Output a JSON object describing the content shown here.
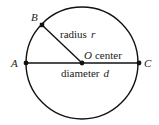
{
  "diagram": {
    "type": "circle-geometry",
    "colors": {
      "stroke": "#111111",
      "text": "#222222",
      "background": "#ffffff"
    },
    "circle": {
      "cx": 82,
      "cy": 63,
      "r": 56
    },
    "points": [
      {
        "id": "A",
        "label": "A",
        "x": 26,
        "y": 63
      },
      {
        "id": "B",
        "label": "B",
        "x": 42,
        "y": 25
      },
      {
        "id": "C",
        "label": "C",
        "x": 139,
        "y": 63
      },
      {
        "id": "O",
        "label": "O",
        "x": 82,
        "y": 63
      }
    ],
    "segments": [
      {
        "from": "A",
        "to": "C",
        "name": "diameter"
      },
      {
        "from": "B",
        "to": "O",
        "name": "radius"
      }
    ],
    "labels": {
      "point_a": "A",
      "point_b": "B",
      "point_c": "C",
      "point_o": "O",
      "center_word": "center",
      "radius_word": "radius",
      "radius_symbol": "r",
      "diameter_word": "diameter",
      "diameter_symbol": "d"
    }
  }
}
